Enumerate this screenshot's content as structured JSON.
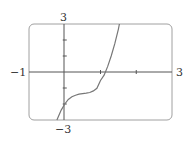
{
  "chart_data": {
    "type": "line",
    "title": "",
    "xlabel": "",
    "ylabel": "",
    "xlim": [
      -1,
      3
    ],
    "ylim": [
      -3,
      3
    ],
    "grid": false,
    "legend": null,
    "tick_labels": {
      "x_min": "−1",
      "x_max": "3",
      "y_max": "3",
      "y_min": "−3"
    },
    "x_ticks": [
      1,
      2
    ],
    "y_ticks": [
      -2,
      -1,
      1,
      2
    ],
    "series": [
      {
        "name": "f(x)",
        "description": "increasing cubic-like curve with a near-flat section around y≈-1.4 for x≈0.2–0.7, passing through (0,-2), crossing x-axis near x≈1.15, exiting top at x≈1.53",
        "x": [
          -0.22,
          -0.1,
          0,
          0.1,
          0.2,
          0.3,
          0.4,
          0.5,
          0.6,
          0.7,
          0.8,
          0.9,
          1.0,
          1.1,
          1.2,
          1.3,
          1.4,
          1.5,
          1.53
        ],
        "y": [
          -3.0,
          -2.38,
          -2.0,
          -1.72,
          -1.55,
          -1.45,
          -1.39,
          -1.35,
          -1.32,
          -1.28,
          -1.18,
          -1.02,
          -0.53,
          -0.2,
          0.35,
          1.0,
          1.77,
          2.68,
          3.0
        ]
      }
    ]
  },
  "colors": {
    "frame": "#9a9a9a",
    "axis": "#555555",
    "curve": "#777777",
    "text": "#333333"
  }
}
